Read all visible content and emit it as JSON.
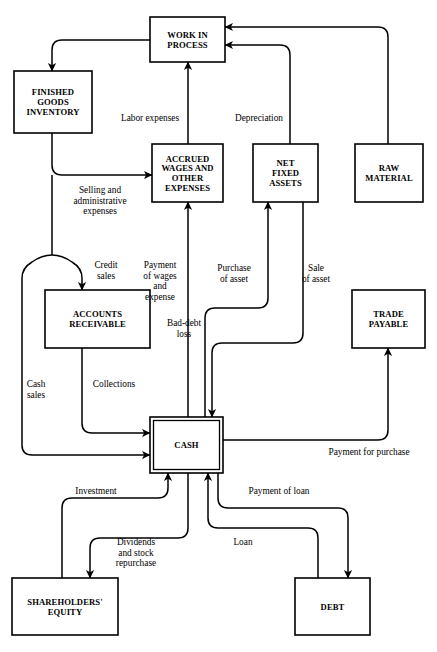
{
  "diagram": {
    "type": "flowchart",
    "width": 437,
    "height": 652,
    "background_color": "#ffffff",
    "line_color": "#000000",
    "nodes": [
      {
        "id": "work-in-process",
        "label": "WORK IN\nPROCESS",
        "x": 150,
        "y": 17,
        "w": 75,
        "h": 45,
        "double_border": false
      },
      {
        "id": "finished-goods",
        "label": "FINISHED\nGOODS\nINVENTORY",
        "x": 14,
        "y": 71,
        "w": 78,
        "h": 62,
        "double_border": false
      },
      {
        "id": "accrued-wages",
        "label": "ACCRUED\nWAGES AND\nOTHER\nEXPENSES",
        "x": 152,
        "y": 144,
        "w": 71,
        "h": 58,
        "double_border": false
      },
      {
        "id": "net-fixed-assets",
        "label": "NET\nFIXED\nASSETS",
        "x": 253,
        "y": 144,
        "w": 65,
        "h": 58,
        "double_border": false
      },
      {
        "id": "raw-material",
        "label": "RAW\nMATERIAL",
        "x": 355,
        "y": 144,
        "w": 68,
        "h": 58,
        "double_border": false
      },
      {
        "id": "accounts-receivable",
        "label": "ACCOUNTS\nRECEIVABLE",
        "x": 45,
        "y": 290,
        "w": 105,
        "h": 58,
        "double_border": false
      },
      {
        "id": "trade-payable",
        "label": "TRADE\nPAYABLE",
        "x": 352,
        "y": 290,
        "w": 73,
        "h": 58,
        "double_border": false
      },
      {
        "id": "cash",
        "label": "CASH",
        "x": 150,
        "y": 417,
        "w": 73,
        "h": 56,
        "double_border": true
      },
      {
        "id": "shareholders-equity",
        "label": "SHAREHOLDERS'\nEQUITY",
        "x": 12,
        "y": 578,
        "w": 106,
        "h": 57,
        "double_border": false
      },
      {
        "id": "debt",
        "label": "DEBT",
        "x": 295,
        "y": 578,
        "w": 75,
        "h": 57,
        "double_border": false
      }
    ],
    "edges": [
      {
        "id": "wip-to-fgi",
        "from": "work-in-process",
        "to": "finished-goods",
        "label": "",
        "path": "M150,40 L62,40 Q52,40 52,50 L52,71",
        "arrow": "down",
        "label_x": 0,
        "label_y": 0
      },
      {
        "id": "labor-expenses",
        "from": "accrued-wages",
        "to": "work-in-process",
        "label": "Labor expenses",
        "path": "M188,144 L188,62",
        "arrow": "up",
        "label_x": 150,
        "label_y": 121
      },
      {
        "id": "depreciation",
        "from": "net-fixed-assets",
        "to": "work-in-process",
        "label": "Depreciation",
        "path": "M290,144 L290,55 Q290,45 280,45 L225,45",
        "arrow": "left",
        "label_x": 259,
        "label_y": 121
      },
      {
        "id": "raw-material-to-wip",
        "from": "raw-material",
        "to": "work-in-process",
        "label": "",
        "path": "M388,144 L388,37 Q388,27 378,27 L225,27",
        "arrow": "left",
        "label_x": 0,
        "label_y": 0
      },
      {
        "id": "selling-admin",
        "from": "finished-goods",
        "to": "accrued-wages",
        "label": "Selling and\nadministrative\nexpenses",
        "path": "M52,133 L52,165 Q52,175 62,175 L152,175",
        "arrow": "right",
        "label_x": 100,
        "label_y": 193
      },
      {
        "id": "fgi-down-trunk",
        "from": "finished-goods",
        "to": "split",
        "label": "",
        "path": "M52,175 L52,255",
        "arrow": "none",
        "label_x": 0,
        "label_y": 0
      },
      {
        "id": "credit-sales",
        "from": "split",
        "to": "accounts-receivable",
        "label": "Credit\nsales",
        "path": "M52,255 Q62,255 72,262 Q82,268 82,278 L82,290",
        "arrow": "down",
        "label_x": 106,
        "label_y": 268
      },
      {
        "id": "cash-sales",
        "from": "split",
        "to": "cash",
        "label": "Cash\nsales",
        "path": "M52,255 Q42,255 32,262 Q22,268 22,278 L22,445 Q22,455 32,455 L150,455",
        "arrow": "right",
        "label_x": 36,
        "label_y": 387
      },
      {
        "id": "collections",
        "from": "accounts-receivable",
        "to": "cash",
        "label": "Collections",
        "path": "M82,348 L82,423 Q82,433 92,433 L150,433",
        "arrow": "right",
        "label_x": 114,
        "label_y": 387
      },
      {
        "id": "bad-debt-loss",
        "from": "accounts-receivable",
        "to": "",
        "label": "Bad-debt\nloss",
        "path": "",
        "arrow": "none",
        "label_x": 184,
        "label_y": 326
      },
      {
        "id": "payment-of-wages",
        "from": "cash",
        "to": "accrued-wages",
        "label": "Payment\nof wages\nand\nexpense",
        "path": "M188,417 L188,202",
        "arrow": "up",
        "label_x": 160,
        "label_y": 268
      },
      {
        "id": "purchase-of-asset",
        "from": "cash",
        "to": "net-fixed-assets",
        "label": "Purchase\nof asset",
        "path": "M205,417 L205,318 Q205,308 215,308 L258,308 Q268,308 268,298 L268,202",
        "arrow": "up",
        "label_x": 234,
        "label_y": 271
      },
      {
        "id": "sale-of-asset",
        "from": "net-fixed-assets",
        "to": "cash",
        "label": "Sale\nof asset",
        "path": "M303,202 L303,333 Q303,343 293,343 L222,343 Q212,343 212,353 L212,417",
        "arrow": "down",
        "label_x": 316,
        "label_y": 271
      },
      {
        "id": "payment-for-purchase",
        "from": "cash",
        "to": "trade-payable",
        "label": "Payment for purchase",
        "path": "M223,440 L378,440 Q388,440 388,430 L388,348",
        "arrow": "up",
        "label_x": 369,
        "label_y": 455
      },
      {
        "id": "investment",
        "from": "shareholders-equity",
        "to": "cash",
        "label": "Investment",
        "path": "M62,578 L62,508 Q62,498 72,498 L158,498 Q168,498 168,488 L168,473",
        "arrow": "up",
        "label_x": 96,
        "label_y": 494
      },
      {
        "id": "dividends",
        "from": "cash",
        "to": "shareholders-equity",
        "label": "Dividends\nand stock\nrepurchase",
        "path": "M188,473 L188,528 Q188,538 178,538 L100,538 Q90,538 90,548 L90,578",
        "arrow": "down",
        "label_x": 136,
        "label_y": 545
      },
      {
        "id": "loan",
        "from": "debt",
        "to": "cash",
        "label": "Loan",
        "path": "M318,578 L318,538 Q318,528 308,528 L218,528 Q208,528 208,518 L208,473",
        "arrow": "up",
        "label_x": 243,
        "label_y": 545
      },
      {
        "id": "payment-of-loan",
        "from": "cash",
        "to": "debt",
        "label": "Payment of loan",
        "path": "M218,473 L218,498 Q218,508 228,508 L338,508 Q348,508 348,518 L348,578",
        "arrow": "down",
        "label_x": 279,
        "label_y": 494
      }
    ]
  }
}
